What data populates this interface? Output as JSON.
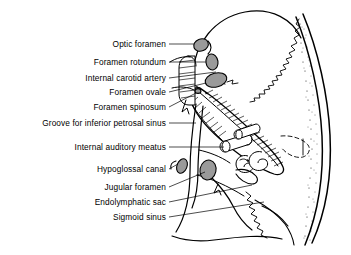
{
  "figure": {
    "type": "anatomical-line-diagram",
    "view": "oblique internal view of the right middle and posterior cranial fossae",
    "background_color": "#ffffff",
    "ink_color": "#000000",
    "foramen_fill_color": "#9a9a9a",
    "style": "black and white pen-and-ink line art with stippled diploe and hatched petrous bone"
  },
  "labels": [
    {
      "id": "optic-foramen",
      "text": "Optic foramen",
      "text_right_x": 166,
      "y": 44,
      "leader": [
        [
          169,
          44
        ],
        [
          196,
          44
        ]
      ]
    },
    {
      "id": "foramen-rotundum",
      "text": "Foramen rotundum",
      "text_right_x": 166,
      "y": 62,
      "leader": [
        [
          169,
          62
        ],
        [
          203,
          62
        ]
      ]
    },
    {
      "id": "internal-carotid-artery",
      "text": "Internal carotid artery",
      "text_right_x": 166,
      "y": 78,
      "leader": [
        [
          169,
          78
        ],
        [
          215,
          72
        ]
      ]
    },
    {
      "id": "foramen-ovale",
      "text": "Foramen ovale",
      "text_right_x": 166,
      "y": 92,
      "leader": [
        [
          169,
          92
        ],
        [
          200,
          86
        ]
      ]
    },
    {
      "id": "foramen-spinosum",
      "text": "Foramen spinosum",
      "text_right_x": 166,
      "y": 107,
      "leader": [
        [
          169,
          107
        ],
        [
          196,
          95
        ]
      ]
    },
    {
      "id": "groove-inferior-petrosal-sinus",
      "text": "Groove for inferior petrosal sinus",
      "text_right_x": 166,
      "y": 123,
      "leader": [
        [
          169,
          123
        ],
        [
          196,
          123
        ]
      ]
    },
    {
      "id": "internal-auditory-meatus",
      "text": "Internal auditory meatus",
      "text_right_x": 166,
      "y": 147,
      "leader": [
        [
          169,
          147
        ],
        [
          225,
          147
        ]
      ]
    },
    {
      "id": "hypoglossal-canal",
      "text": "Hypoglossal canal",
      "text_right_x": 166,
      "y": 169,
      "leader": [
        [
          169,
          169
        ],
        [
          184,
          165
        ]
      ]
    },
    {
      "id": "jugular-foramen",
      "text": "Jugular foramen",
      "text_right_x": 166,
      "y": 187,
      "leader": [
        [
          169,
          187
        ],
        [
          207,
          170
        ]
      ]
    },
    {
      "id": "endolymphatic-sac",
      "text": "Endolymphatic sac",
      "text_right_x": 166,
      "y": 202,
      "leader": [
        [
          169,
          202
        ],
        [
          250,
          186
        ]
      ]
    },
    {
      "id": "sigmoid-sinus",
      "text": "Sigmoid sinus",
      "text_right_x": 166,
      "y": 217,
      "leader": [
        [
          169,
          217
        ],
        [
          262,
          203
        ]
      ]
    }
  ],
  "structures": [
    {
      "id": "cranial-vault",
      "name": "cranial vault outline"
    },
    {
      "id": "lambdoid-suture",
      "name": "zigzag suture line"
    },
    {
      "id": "diploe-band",
      "name": "stippled diploe of occipital bone"
    },
    {
      "id": "petrous-ridge",
      "name": "hatched petrous temporal bone"
    },
    {
      "id": "cochlea",
      "name": "cochlear spiral"
    },
    {
      "id": "internal-auditory-canal-tube",
      "name": "internal auditory meatus tube"
    },
    {
      "id": "carotid-canal",
      "name": "banded internal carotid canal"
    }
  ]
}
